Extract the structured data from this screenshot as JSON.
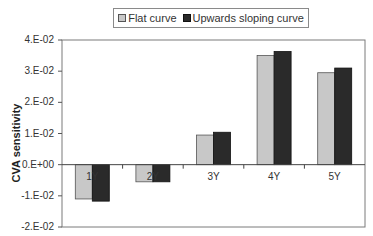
{
  "chart_data": {
    "type": "bar",
    "title": "",
    "xlabel": "",
    "ylabel": "CVA sensitivity",
    "categories": [
      "1Y",
      "2Y",
      "3Y",
      "4Y",
      "5Y"
    ],
    "series": [
      {
        "name": "Flat curve",
        "color": "#c8c8c8",
        "values": [
          -0.011,
          -0.0055,
          0.0095,
          0.035,
          0.0295
        ]
      },
      {
        "name": "Upwards sloping curve",
        "color": "#2a2a2a",
        "values": [
          -0.0117,
          -0.0055,
          0.0104,
          0.0363,
          0.031
        ]
      }
    ],
    "ylim": [
      -0.02,
      0.04
    ],
    "yticks": [
      0.04,
      0.03,
      0.02,
      0.01,
      0.0,
      -0.01,
      -0.02
    ],
    "ytick_labels": [
      "4.E-02",
      "3.E-02",
      "2.E-02",
      "1.E-02",
      "0.E+00",
      "-1.E-02",
      "-2.E-02"
    ],
    "grid": false,
    "legend_position": "top"
  },
  "legend": {
    "items": [
      {
        "label": "Flat curve"
      },
      {
        "label": "Upwards sloping curve"
      }
    ]
  },
  "axis": {
    "ylabel": "CVA sensitivity"
  }
}
